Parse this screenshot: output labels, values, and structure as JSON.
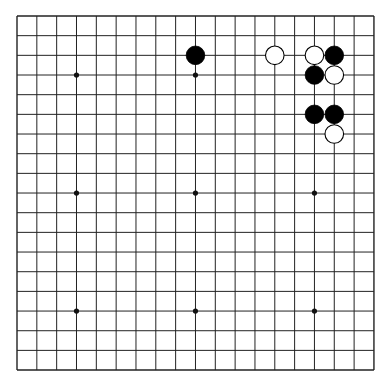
{
  "board": {
    "size": 19,
    "origin_x": 17,
    "origin_y": 16,
    "spacing_x": 19.83,
    "spacing_y": 19.67,
    "line_color": "#222222",
    "background": "#ffffff",
    "star_points": [
      [
        3,
        3
      ],
      [
        9,
        3
      ],
      [
        15,
        3
      ],
      [
        3,
        9
      ],
      [
        9,
        9
      ],
      [
        15,
        9
      ],
      [
        3,
        15
      ],
      [
        9,
        15
      ],
      [
        15,
        15
      ]
    ],
    "stones": [
      {
        "color": "black",
        "col": 9,
        "row": 2
      },
      {
        "color": "white",
        "col": 13,
        "row": 2
      },
      {
        "color": "white",
        "col": 15,
        "row": 2
      },
      {
        "color": "black",
        "col": 16,
        "row": 2
      },
      {
        "color": "black",
        "col": 15,
        "row": 3
      },
      {
        "color": "white",
        "col": 16,
        "row": 3
      },
      {
        "color": "black",
        "col": 15,
        "row": 5
      },
      {
        "color": "black",
        "col": 16,
        "row": 5
      },
      {
        "color": "white",
        "col": 16,
        "row": 6
      }
    ]
  }
}
